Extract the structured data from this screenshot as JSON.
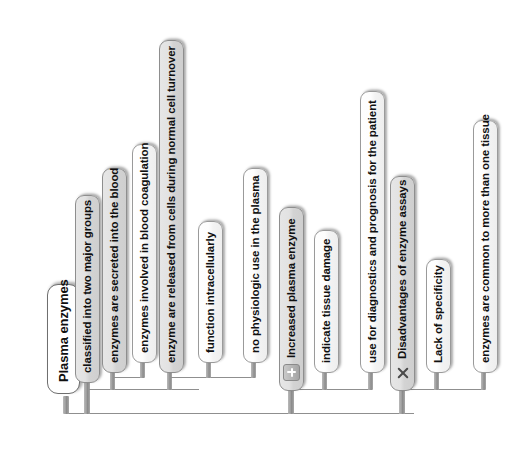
{
  "diagram": {
    "title": "Plasma enzymes",
    "orientation": "vertical-rotated-mindmap",
    "root": {
      "id": "root",
      "label": "Plasma enzymes",
      "type": "root"
    },
    "nodes": [
      {
        "id": "n1",
        "label": "classified into two major groups",
        "type": "parent",
        "level": 1,
        "icon": "none"
      },
      {
        "id": "n2",
        "label": "enzymes are secreted into the blood",
        "type": "parent",
        "level": 2,
        "icon": "none"
      },
      {
        "id": "n3",
        "label": "enzymes involved in blood coagulation",
        "type": "leaf",
        "level": 3,
        "icon": "none"
      },
      {
        "id": "n4",
        "label": "enzyme are released from cells during normal cell turnover",
        "type": "parent",
        "level": 2,
        "icon": "none"
      },
      {
        "id": "n5",
        "label": "function intracellularly",
        "type": "leaf",
        "level": 3,
        "icon": "none"
      },
      {
        "id": "n6",
        "label": "no physiologic use in the plasma",
        "type": "leaf",
        "level": 3,
        "icon": "none"
      },
      {
        "id": "n7",
        "label": "Increased plasma enzyme",
        "type": "parent",
        "level": 1,
        "icon": "plus-badge-icon"
      },
      {
        "id": "n8",
        "label": "indicate tissue damage",
        "type": "leaf",
        "level": 2,
        "icon": "none"
      },
      {
        "id": "n9",
        "label": "use for diagnostics and prognosis for the patient",
        "type": "leaf",
        "level": 2,
        "icon": "none"
      },
      {
        "id": "n10",
        "label": "Disadvantages of enzyme assays",
        "type": "parent",
        "level": 1,
        "icon": "cross-icon"
      },
      {
        "id": "n11",
        "label": "Lack of specificity",
        "type": "leaf",
        "level": 2,
        "icon": "none"
      },
      {
        "id": "n12",
        "label": "enzymes are common to more than one tissue",
        "type": "leaf",
        "level": 2,
        "icon": "none"
      }
    ],
    "colors": {
      "background": "#ffffff",
      "leaf_fill": "#fdfdfd",
      "parent_fill": "#dcdcdc",
      "border": "#9a9a9a",
      "connector": "#8f8f8f",
      "stem": "#9d9d9d",
      "text": "#101010"
    }
  }
}
